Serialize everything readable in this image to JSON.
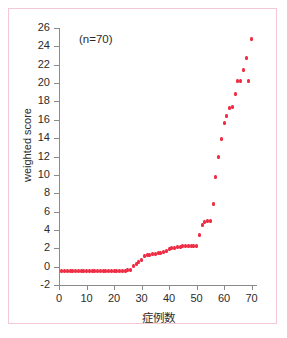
{
  "chart_data": {
    "type": "scatter",
    "title": "",
    "annotation": "(n=70)",
    "xlabel": "症例数",
    "ylabel": "weighted score",
    "xlim": [
      0,
      72
    ],
    "ylim": [
      -2,
      26
    ],
    "xticks": [
      0,
      10,
      20,
      30,
      40,
      50,
      60,
      70
    ],
    "yticks": [
      -2,
      0,
      2,
      4,
      6,
      8,
      10,
      12,
      14,
      16,
      18,
      20,
      22,
      24,
      26
    ],
    "xtick_labels": [
      "0",
      "10",
      "20",
      "30",
      "40",
      "50",
      "60",
      "70"
    ],
    "ytick_labels": [
      "-2",
      "0",
      "2",
      "4",
      "6",
      "8",
      "10",
      "12",
      "14",
      "16",
      "18",
      "20",
      "22",
      "24",
      "26"
    ],
    "grid": false,
    "legend": null,
    "marker_color": "#ef2d45",
    "axis_color": "#8a8a8a",
    "frame_color": "#f2c9d2",
    "n": 70,
    "series": [
      {
        "name": "weighted score",
        "x": [
          1,
          2,
          3,
          4,
          5,
          6,
          7,
          8,
          9,
          10,
          11,
          12,
          13,
          14,
          15,
          16,
          17,
          18,
          19,
          20,
          21,
          22,
          23,
          24,
          25,
          26,
          27,
          28,
          29,
          30,
          31,
          32,
          33,
          34,
          35,
          36,
          37,
          38,
          39,
          40,
          41,
          42,
          43,
          44,
          45,
          46,
          47,
          48,
          49,
          50,
          51,
          52,
          53,
          54,
          55,
          56,
          57,
          58,
          59,
          60,
          61,
          62,
          63,
          64,
          65,
          66,
          67,
          68,
          69,
          70
        ],
        "values": [
          -0.5,
          -0.5,
          -0.5,
          -0.5,
          -0.5,
          -0.5,
          -0.5,
          -0.5,
          -0.5,
          -0.5,
          -0.5,
          -0.5,
          -0.5,
          -0.5,
          -0.5,
          -0.5,
          -0.5,
          -0.5,
          -0.5,
          -0.5,
          -0.5,
          -0.5,
          -0.5,
          -0.5,
          -0.4,
          -0.35,
          0.1,
          0.3,
          0.5,
          0.75,
          1.2,
          1.25,
          1.3,
          1.35,
          1.4,
          1.45,
          1.5,
          1.6,
          1.75,
          1.9,
          2.0,
          2.05,
          2.1,
          2.15,
          2.2,
          2.2,
          2.2,
          2.2,
          2.2,
          2.25,
          3.5,
          4.5,
          4.9,
          5.0,
          5.0,
          6.8,
          9.75,
          11.9,
          13.9,
          15.7,
          16.4,
          17.3,
          17.4,
          18.8,
          20.25,
          20.25,
          21.4,
          22.7,
          20.2,
          24.8
        ]
      }
    ]
  }
}
